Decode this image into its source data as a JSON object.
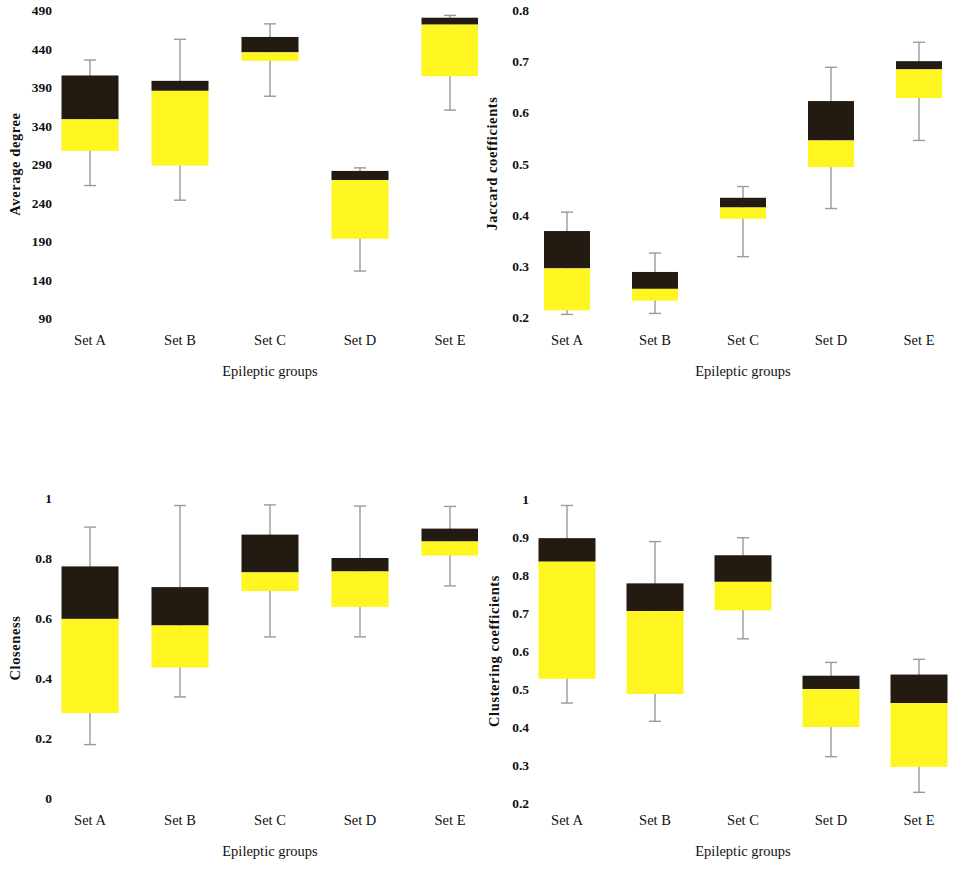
{
  "figure": {
    "panel_count": 4,
    "colors": {
      "upper_box": "#231b11",
      "lower_box": "#fff520",
      "whisker": "#9a9a9a",
      "text": "#111111",
      "background": "#ffffff"
    }
  },
  "chart_data": [
    {
      "type": "box",
      "id": "average-degree",
      "title": "",
      "xlabel": "Epileptic groups",
      "ylabel": "Average degree",
      "categories": [
        "Set A",
        "Set B",
        "Set C",
        "Set D",
        "Set E"
      ],
      "yticks": [
        490,
        440,
        390,
        340,
        290,
        240,
        190,
        140,
        90
      ],
      "ylim": [
        90,
        505
      ],
      "grid": false,
      "legend": "none",
      "boxes": [
        {
          "category": "Set A",
          "whisker_high": 425,
          "q3": 405,
          "median": 348,
          "q1": 307,
          "whisker_low": 262
        },
        {
          "category": "Set B",
          "whisker_high": 452,
          "q3": 398,
          "median": 385,
          "q1": 288,
          "whisker_low": 243
        },
        {
          "category": "Set C",
          "whisker_high": 472,
          "q3": 455,
          "median": 435,
          "q1": 424,
          "whisker_low": 378
        },
        {
          "category": "Set D",
          "whisker_high": 285,
          "q3": 281,
          "median": 269,
          "q1": 193,
          "whisker_low": 151
        },
        {
          "category": "Set E",
          "whisker_high": 483,
          "q3": 480,
          "median": 471,
          "q1": 404,
          "whisker_low": 360
        }
      ]
    },
    {
      "type": "box",
      "id": "jaccard-coefficients",
      "title": "",
      "xlabel": "Epileptic groups",
      "ylabel": "Jaccard coefficients",
      "categories": [
        "Set A",
        "Set B",
        "Set C",
        "Set D",
        "Set E"
      ],
      "yticks": [
        0.8,
        0.7,
        0.6,
        0.5,
        0.4,
        0.3,
        0.2
      ],
      "ylim": [
        0.2,
        0.82
      ],
      "grid": false,
      "legend": "none",
      "boxes": [
        {
          "category": "Set A",
          "whisker_high": 0.405,
          "q3": 0.368,
          "median": 0.295,
          "q1": 0.213,
          "whisker_low": 0.205
        },
        {
          "category": "Set B",
          "whisker_high": 0.325,
          "q3": 0.288,
          "median": 0.255,
          "q1": 0.232,
          "whisker_low": 0.207
        },
        {
          "category": "Set C",
          "whisker_high": 0.455,
          "q3": 0.433,
          "median": 0.414,
          "q1": 0.392,
          "whisker_low": 0.318
        },
        {
          "category": "Set D",
          "whisker_high": 0.688,
          "q3": 0.622,
          "median": 0.545,
          "q1": 0.493,
          "whisker_low": 0.412
        },
        {
          "category": "Set E",
          "whisker_high": 0.737,
          "q3": 0.7,
          "median": 0.684,
          "q1": 0.628,
          "whisker_low": 0.545
        }
      ]
    },
    {
      "type": "box",
      "id": "closeness",
      "title": "",
      "xlabel": "Epileptic groups",
      "ylabel": "Closeness",
      "categories": [
        "Set A",
        "Set B",
        "Set C",
        "Set D",
        "Set E"
      ],
      "yticks": [
        1,
        0.8,
        0.6,
        0.4,
        0.2,
        0
      ],
      "ylim": [
        0,
        1.02
      ],
      "grid": false,
      "legend": "none",
      "boxes": [
        {
          "category": "Set A",
          "whisker_high": 0.903,
          "q3": 0.772,
          "median": 0.597,
          "q1": 0.283,
          "whisker_low": 0.178
        },
        {
          "category": "Set B",
          "whisker_high": 0.975,
          "q3": 0.703,
          "median": 0.575,
          "q1": 0.435,
          "whisker_low": 0.337
        },
        {
          "category": "Set C",
          "whisker_high": 0.977,
          "q3": 0.878,
          "median": 0.752,
          "q1": 0.69,
          "whisker_low": 0.537
        },
        {
          "category": "Set D",
          "whisker_high": 0.973,
          "q3": 0.8,
          "median": 0.755,
          "q1": 0.637,
          "whisker_low": 0.537
        },
        {
          "category": "Set E",
          "whisker_high": 0.972,
          "q3": 0.898,
          "median": 0.855,
          "q1": 0.808,
          "whisker_low": 0.707
        }
      ]
    },
    {
      "type": "box",
      "id": "clustering-coefficients",
      "title": "",
      "xlabel": "Epileptic groups",
      "ylabel": "Clustering coefficients",
      "categories": [
        "Set A",
        "Set B",
        "Set C",
        "Set D",
        "Set E"
      ],
      "yticks": [
        1,
        0.9,
        0.8,
        0.7,
        0.6,
        0.5,
        0.4,
        0.3,
        0.2
      ],
      "ylim": [
        0.2,
        1.02
      ],
      "grid": false,
      "legend": "none",
      "boxes": [
        {
          "category": "Set A",
          "whisker_high": 0.983,
          "q3": 0.897,
          "median": 0.835,
          "q1": 0.527,
          "whisker_low": 0.463
        },
        {
          "category": "Set B",
          "whisker_high": 0.888,
          "q3": 0.778,
          "median": 0.705,
          "q1": 0.487,
          "whisker_low": 0.415
        },
        {
          "category": "Set C",
          "whisker_high": 0.898,
          "q3": 0.852,
          "median": 0.782,
          "q1": 0.707,
          "whisker_low": 0.632
        },
        {
          "category": "Set D",
          "whisker_high": 0.57,
          "q3": 0.535,
          "median": 0.5,
          "q1": 0.4,
          "whisker_low": 0.322
        },
        {
          "category": "Set E",
          "whisker_high": 0.578,
          "q3": 0.538,
          "median": 0.463,
          "q1": 0.295,
          "whisker_low": 0.228
        }
      ]
    }
  ],
  "panels": {
    "average_degree": {
      "ylabel": "Average degree",
      "xlabel": "Epileptic groups",
      "ytick_labels": [
        "490",
        "440",
        "390",
        "340",
        "290",
        "240",
        "190",
        "140",
        "90"
      ],
      "xtick_labels": [
        "Set A",
        "Set B",
        "Set C",
        "Set D",
        "Set E"
      ]
    },
    "jaccard": {
      "ylabel": "Jaccard coefficients",
      "xlabel": "Epileptic groups",
      "ytick_labels": [
        "0.8",
        "0.7",
        "0.6",
        "0.5",
        "0.4",
        "0.3",
        "0.2"
      ],
      "xtick_labels": [
        "Set A",
        "Set B",
        "Set C",
        "Set D",
        "Set E"
      ]
    },
    "closeness": {
      "ylabel": "Closeness",
      "xlabel": "Epileptic groups",
      "ytick_labels": [
        "1",
        "0.8",
        "0.6",
        "0.4",
        "0.2",
        "0"
      ],
      "xtick_labels": [
        "Set A",
        "Set B",
        "Set C",
        "Set D",
        "Set E"
      ]
    },
    "clustering": {
      "ylabel": "Clustering coefficients",
      "xlabel": "Epileptic groups",
      "ytick_labels": [
        "1",
        "0.9",
        "0.8",
        "0.7",
        "0.6",
        "0.5",
        "0.4",
        "0.3",
        "0.2"
      ],
      "xtick_labels": [
        "Set A",
        "Set B",
        "Set C",
        "Set D",
        "Set E"
      ]
    }
  }
}
